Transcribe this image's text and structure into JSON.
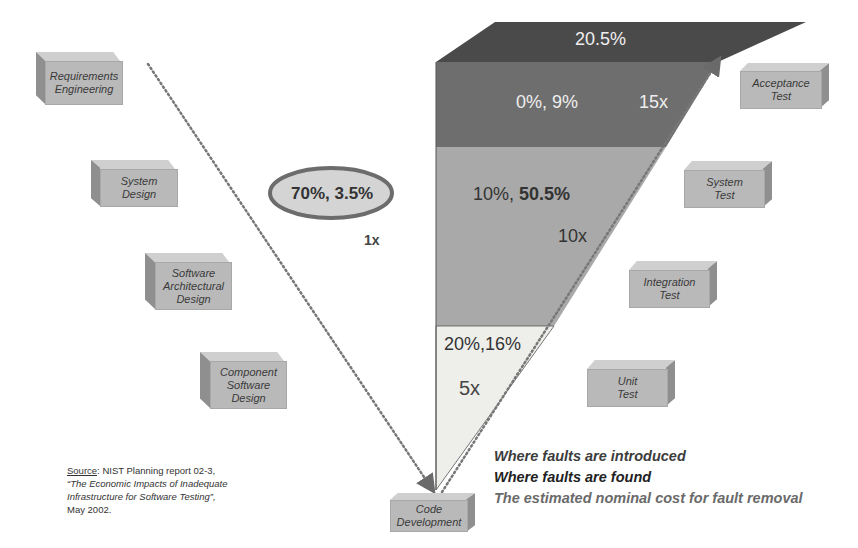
{
  "left_phases": [
    {
      "label_lines": [
        "Requirements",
        "Engineering"
      ]
    },
    {
      "label_lines": [
        "System",
        "Design"
      ]
    },
    {
      "label_lines": [
        "Software",
        "Architectural",
        "Design"
      ]
    },
    {
      "label_lines": [
        "Component",
        "Software",
        "Design"
      ]
    }
  ],
  "bottom_phase": {
    "label_lines": [
      "Code",
      "Development"
    ]
  },
  "right_phases": [
    {
      "label_lines": [
        "Acceptance",
        "Test"
      ]
    },
    {
      "label_lines": [
        "System",
        "Test"
      ]
    },
    {
      "label_lines": [
        "Integration",
        "Test"
      ]
    },
    {
      "label_lines": [
        "Unit",
        "Test"
      ]
    }
  ],
  "ellipse": {
    "text": "70%, 3.5%",
    "cost": "1x"
  },
  "bands": {
    "top": {
      "text": "20.5%"
    },
    "acceptance": {
      "text": "0%, 9%",
      "cost": "15x"
    },
    "system_integration": {
      "text_a": "10%, ",
      "text_b": "50.5%",
      "cost": "10x"
    },
    "unit": {
      "text": "20%,16%",
      "cost": "5x"
    }
  },
  "legend": {
    "introduced": "Where faults are introduced",
    "found": "Where faults are found",
    "cost": "The estimated nominal cost for fault removal"
  },
  "source": {
    "prefix": "Source",
    "line1": ": NIST Planning report 02-3,",
    "line2": "“The Economic Impacts of Inadequate",
    "line3": "Infrastructure for Software Testing”,",
    "line4": "May 2002."
  },
  "colors": {
    "top_band": "#4a4a4a",
    "acceptance_band": "#6e6e6e",
    "mid_band": "#a9a9a9",
    "light_band": "#eeeeea",
    "box_front": "#b9b9b9",
    "legend_introduced": "#3c3c3c",
    "legend_found": "#222222",
    "legend_cost": "#6a6a6a"
  }
}
